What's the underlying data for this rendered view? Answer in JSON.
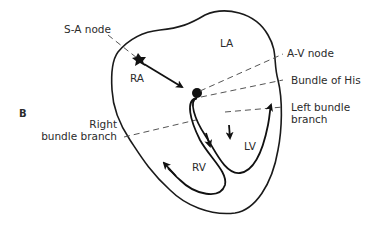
{
  "figure": {
    "panel_label": "B",
    "chambers": {
      "ra": "RA",
      "la": "LA",
      "rv": "RV",
      "lv": "LV"
    },
    "labels": {
      "sa_node": "S-A node",
      "av_node": "A-V node",
      "bundle_of_his": "Bundle of His",
      "left_bundle_line1": "Left bundle",
      "left_bundle_line2": "branch",
      "right_bundle_line1": "Right",
      "right_bundle_line2": "bundle branch"
    },
    "colors": {
      "ink": "#1a1a1a",
      "background": "#ffffff"
    }
  }
}
